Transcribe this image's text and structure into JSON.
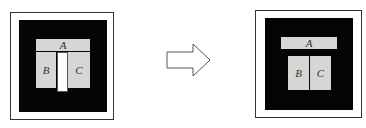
{
  "diagram": {
    "type": "block-rearrangement",
    "before": {
      "blocks": [
        {
          "id": "A",
          "label": "A"
        },
        {
          "id": "B",
          "label": "B"
        },
        {
          "id": "C",
          "label": "C"
        }
      ],
      "has_white_gap_between_B_C": true
    },
    "after": {
      "blocks": [
        {
          "id": "A",
          "label": "A"
        },
        {
          "id": "B",
          "label": "B"
        },
        {
          "id": "C",
          "label": "C"
        }
      ],
      "has_white_gap_between_B_C": false
    },
    "arrow": {
      "direction": "right",
      "style": "outlined"
    }
  },
  "colors": {
    "background": "#ffffff",
    "inner_field": "#050505",
    "block_fill": "#d6d6d6",
    "frame_stroke": "#333333"
  }
}
